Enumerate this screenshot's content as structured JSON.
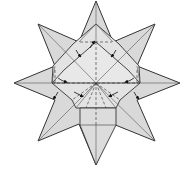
{
  "diagram": {
    "type": "origami-fold-diagram",
    "colors": {
      "paper_fill": "#d9d9d9",
      "paper_fill_light": "#e6e6e6",
      "stroke": "#333333",
      "crease": "#7a7a7a",
      "background": "#ffffff"
    },
    "outer_points": [
      {
        "name": "top",
        "x": 96,
        "y": 1
      },
      {
        "name": "top-right",
        "x": 155,
        "y": 24
      },
      {
        "name": "right",
        "x": 180,
        "y": 83
      },
      {
        "name": "bottom-right",
        "x": 155,
        "y": 141
      },
      {
        "name": "bottom",
        "x": 96,
        "y": 165
      },
      {
        "name": "bottom-left",
        "x": 38,
        "y": 141
      },
      {
        "name": "left",
        "x": 14,
        "y": 83
      },
      {
        "name": "top-left",
        "x": 38,
        "y": 24
      }
    ],
    "fold_arrows": 8,
    "labels": []
  }
}
